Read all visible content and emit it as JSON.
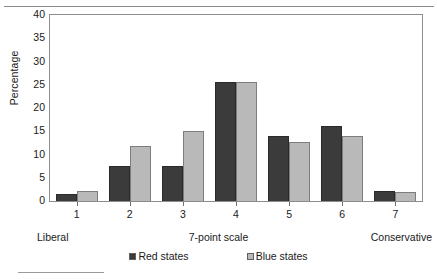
{
  "chart_data": {
    "type": "bar",
    "title": "",
    "xlabel": "7-point scale",
    "ylabel": "Percentage",
    "categories": [
      "1",
      "2",
      "3",
      "4",
      "5",
      "6",
      "7"
    ],
    "scale_endpoints": {
      "low": "Liberal",
      "high": "Conservative"
    },
    "ylim": [
      0,
      40
    ],
    "yticks": [
      0,
      5,
      10,
      15,
      20,
      25,
      30,
      35,
      40
    ],
    "grid": false,
    "legend_position": "bottom",
    "series": [
      {
        "name": "Red states",
        "color": "#3b3b3b",
        "values": [
          1.5,
          7.6,
          7.5,
          25.5,
          14.0,
          16.1,
          2.1
        ]
      },
      {
        "name": "Blue states",
        "color": "#b9b9b9",
        "values": [
          2.2,
          11.9,
          15.0,
          25.6,
          12.7,
          13.9,
          1.9
        ]
      }
    ]
  },
  "axis": {
    "ytick_labels": [
      "40",
      "35",
      "30",
      "25",
      "20",
      "15",
      "10",
      "5",
      "0"
    ],
    "ylabel": "Percentage",
    "xlabel": "7-point scale",
    "xtick_labels": [
      "1",
      "2",
      "3",
      "4",
      "5",
      "6",
      "7"
    ],
    "left_endpoint": "Liberal",
    "right_endpoint": "Conservative"
  },
  "legend": {
    "items": [
      {
        "label": "Red states",
        "color": "#3b3b3b"
      },
      {
        "label": "Blue states",
        "color": "#b9b9b9"
      }
    ]
  }
}
